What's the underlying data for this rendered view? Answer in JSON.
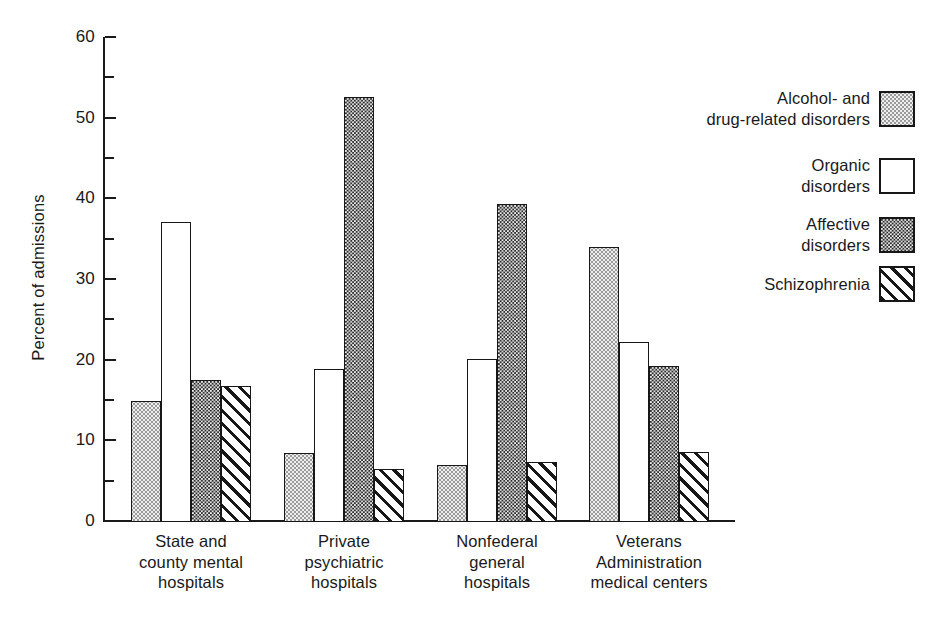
{
  "chart_data": {
    "type": "bar",
    "title": "",
    "xlabel": "",
    "ylabel": "Percent of admissions",
    "ylim": [
      0,
      60
    ],
    "yticks": [
      0,
      10,
      20,
      30,
      40,
      50,
      60
    ],
    "ytick_labels": [
      "0",
      "10",
      "20",
      "30",
      "40",
      "50",
      "60"
    ],
    "yminor_ticks": [
      5,
      15,
      25,
      35,
      45,
      55
    ],
    "grid": false,
    "legend_position": "right",
    "categories": [
      "State and county mental hospitals",
      "Private psychiatric hospitals",
      "Nonfederal general hospitals",
      "Veterans Administration medical centers"
    ],
    "category_label_lines": [
      [
        "State and",
        "county mental",
        "hospitals"
      ],
      [
        "Private",
        "psychiatric",
        "hospitals"
      ],
      [
        "Nonfederal",
        "general",
        "hospitals"
      ],
      [
        "Veterans",
        "Administration",
        "medical  centers"
      ]
    ],
    "series": [
      {
        "name": "Alcohol- and drug-related disorders",
        "label_lines": [
          "Alcohol-  and",
          "drug-related  disorders"
        ],
        "pattern": "light-stipple",
        "values": [
          15.0,
          8.6,
          7.1,
          34.1
        ]
      },
      {
        "name": "Organic disorders",
        "label_lines": [
          "Organic",
          "disorders"
        ],
        "pattern": "open-white",
        "values": [
          37.2,
          19.0,
          20.2,
          22.3
        ]
      },
      {
        "name": "Affective disorders",
        "label_lines": [
          "Affective",
          "disorders"
        ],
        "pattern": "dark-crosshatch",
        "values": [
          17.6,
          52.7,
          39.4,
          19.4
        ]
      },
      {
        "name": "Schizophrenia",
        "label_lines": [
          "Schizophrenia"
        ],
        "pattern": "diagonal-hatch",
        "values": [
          16.9,
          6.6,
          7.5,
          8.7
        ]
      }
    ]
  },
  "colors": {
    "axis": "#1a1a1a",
    "background": "#ffffff",
    "alcohol_fill": "#efefee",
    "organic_fill": "#ffffff",
    "affective_fill": "#2e2e2e",
    "schizophrenia_fill": "#ffffff"
  }
}
